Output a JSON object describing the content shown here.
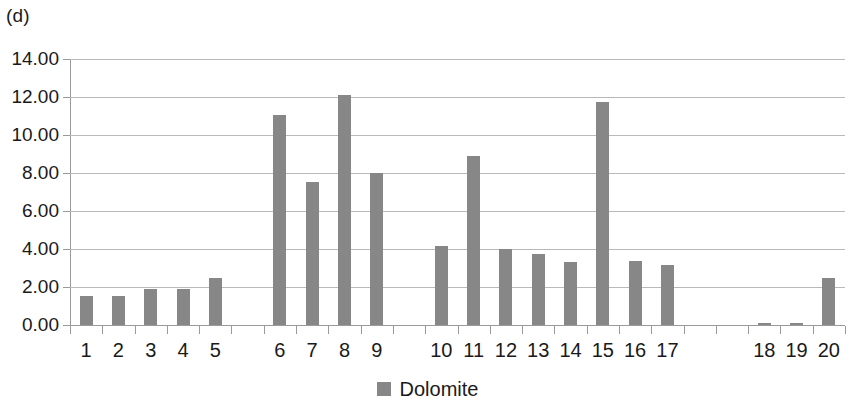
{
  "panel_label": "(d)",
  "legend": {
    "label": "Dolomite",
    "swatch_color": "#878787"
  },
  "style": {
    "bar_color": "#878787",
    "gridline_color": "#b9b9b9",
    "axis_color": "#9a9a9a",
    "background": "#ffffff",
    "text_color": "#1a1a1a"
  },
  "chart_data": {
    "type": "bar",
    "title": "(d)",
    "xlabel": "",
    "ylabel": "",
    "ylim": [
      0,
      14
    ],
    "ytick_labels": [
      "0.00",
      "2.00",
      "4.00",
      "6.00",
      "8.00",
      "10.00",
      "12.00",
      "14.00"
    ],
    "ytick_values": [
      0,
      2,
      4,
      6,
      8,
      10,
      12,
      14
    ],
    "grid": true,
    "legend_position": "bottom-center",
    "series": [
      {
        "name": "Dolomite",
        "color": "#878787",
        "values": [
          1.55,
          1.52,
          1.92,
          1.9,
          2.47,
          11.05,
          7.55,
          12.1,
          8.0,
          4.15,
          8.9,
          4.0,
          3.75,
          3.3,
          11.75,
          3.35,
          3.15,
          0.12,
          0.13,
          2.5
        ]
      }
    ],
    "categories": [
      "1",
      "2",
      "3",
      "4",
      "5",
      "6",
      "7",
      "8",
      "9",
      "10",
      "11",
      "12",
      "13",
      "14",
      "15",
      "16",
      "17",
      "18",
      "19",
      "20"
    ],
    "slots": [
      {
        "label": "1",
        "value": 1.55
      },
      {
        "label": "2",
        "value": 1.52
      },
      {
        "label": "3",
        "value": 1.92
      },
      {
        "label": "4",
        "value": 1.9
      },
      {
        "label": "5",
        "value": 2.47
      },
      {
        "label": "",
        "value": null
      },
      {
        "label": "6",
        "value": 11.05
      },
      {
        "label": "7",
        "value": 7.55
      },
      {
        "label": "8",
        "value": 12.1
      },
      {
        "label": "9",
        "value": 8.0
      },
      {
        "label": "",
        "value": null
      },
      {
        "label": "10",
        "value": 4.15
      },
      {
        "label": "11",
        "value": 8.9
      },
      {
        "label": "12",
        "value": 4.0
      },
      {
        "label": "13",
        "value": 3.75
      },
      {
        "label": "14",
        "value": 3.3
      },
      {
        "label": "15",
        "value": 11.75
      },
      {
        "label": "16",
        "value": 3.35
      },
      {
        "label": "17",
        "value": 3.15
      },
      {
        "label": "",
        "value": null
      },
      {
        "label": "",
        "value": null
      },
      {
        "label": "18",
        "value": 0.12
      },
      {
        "label": "19",
        "value": 0.13
      },
      {
        "label": "20",
        "value": 2.5
      }
    ]
  }
}
